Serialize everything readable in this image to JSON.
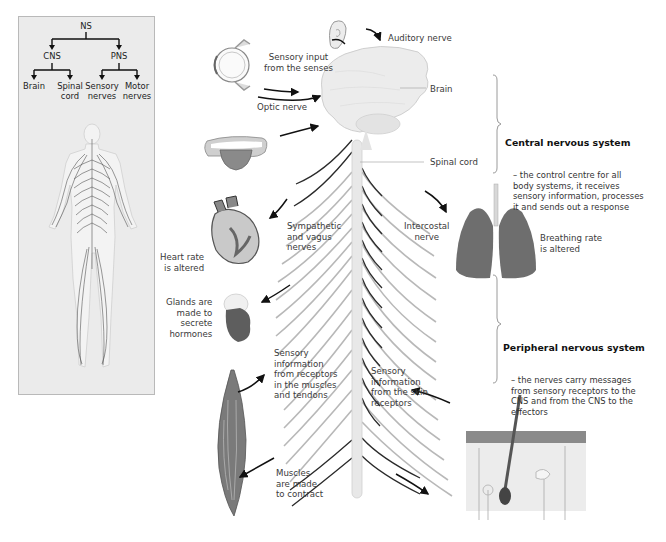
{
  "tree": {
    "root": "NS",
    "level1": [
      "CNS",
      "PNS"
    ],
    "leaves": [
      "Brain",
      "Spinal\ncord",
      "Sensory\nnerves",
      "Motor\nnerves"
    ]
  },
  "labels": {
    "auditory_nerve": "Auditory nerve",
    "sensory_input": "Sensory input\nfrom the senses",
    "optic_nerve": "Optic nerve",
    "brain": "Brain",
    "spinal_cord": "Spinal cord",
    "sympathetic": "Sympathetic\nand vagus\nnerves",
    "intercostal": "Intercostal\nnerve",
    "heart_rate": "Heart rate\nis altered",
    "breathing_rate": "Breathing rate\nis altered",
    "glands": "Glands are\nmade to\nsecrete\nhormones",
    "sensory_muscles": "Sensory\ninformation\nfrom receptors\nin the muscles\nand tendons",
    "sensory_skin": "Sensory\ninformation\nfrom the skin\nreceptors",
    "muscles_contract": "Muscles\nare made\nto contract"
  },
  "cns": {
    "title": "Central nervous system",
    "body": "– the control centre for all\nbody systems, it receives\nsensory information, processes\nit and sends out a response"
  },
  "pns": {
    "title": "Peripheral nervous system",
    "body": "– the nerves carry messages\nfrom sensory receptors to the\nCNS and from the CNS to the\neffectors"
  },
  "icons": [
    "eye-icon",
    "ear-icon",
    "tongue-icon",
    "brain-icon",
    "heart-icon",
    "lungs-icon",
    "gland-icon",
    "muscle-icon",
    "skin-icon",
    "body-nervous-system-icon"
  ],
  "colors": {
    "panel_bg": "#ebebeb",
    "organ_dark": "#6e6e6e",
    "organ_light": "#d8d8d8",
    "nerve_dark": "#2a2a2a",
    "nerve_light": "#b5b5b5"
  }
}
